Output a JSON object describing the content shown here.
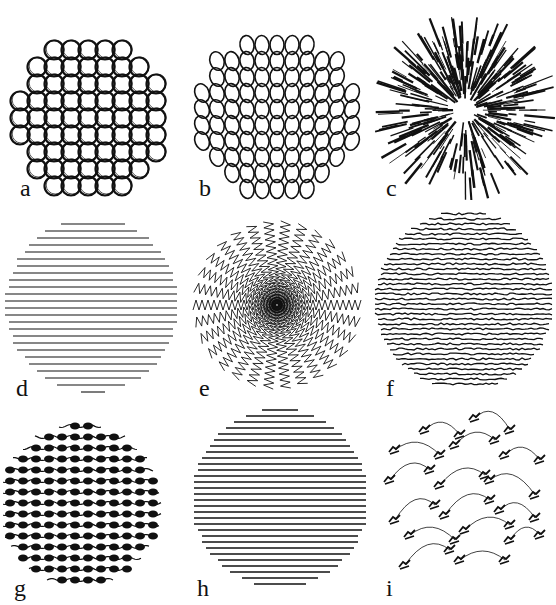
{
  "figure": {
    "panels": [
      {
        "label": "a",
        "pattern": "packed-circles"
      },
      {
        "label": "b",
        "pattern": "loops"
      },
      {
        "label": "c",
        "pattern": "radial-strokes"
      },
      {
        "label": "d",
        "pattern": "horizontal-zigzag"
      },
      {
        "label": "e",
        "pattern": "radial-zigzag"
      },
      {
        "label": "f",
        "pattern": "dense-zigzag"
      },
      {
        "label": "g",
        "pattern": "wavy-rows"
      },
      {
        "label": "h",
        "pattern": "dense-triangles"
      },
      {
        "label": "i",
        "pattern": "arcs-with-hooks"
      }
    ],
    "colors": {
      "ink": "#111111",
      "background": "#ffffff"
    }
  }
}
